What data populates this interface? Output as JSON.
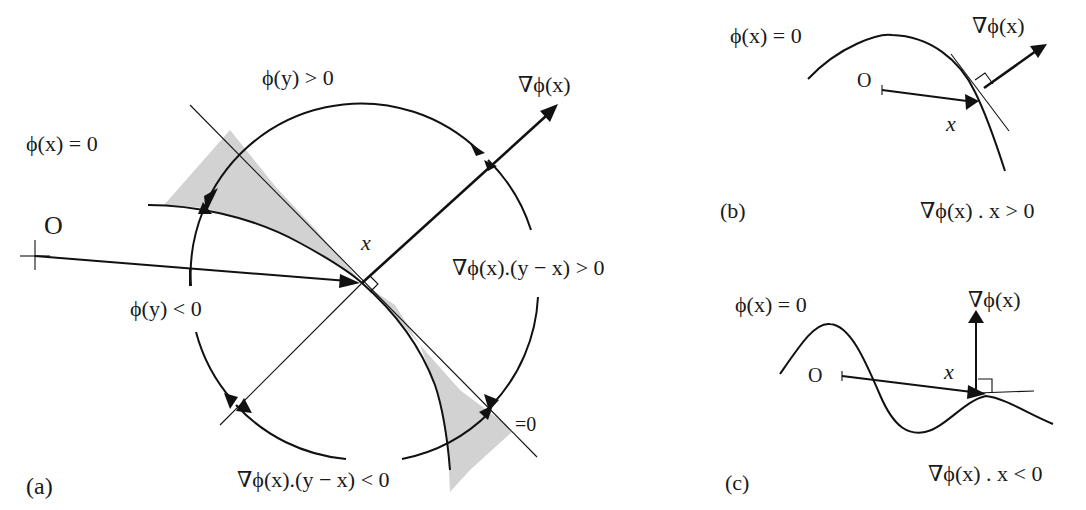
{
  "figure": {
    "panels": [
      {
        "id": "a",
        "caption": "(a)",
        "labels": {
          "phi_x_zero": "ϕ(x) = 0",
          "origin": "O",
          "phi_y_pos": "ϕ(y) > 0",
          "phi_y_neg": "ϕ(y) < 0",
          "grad": "∇ϕ(x)",
          "point_x": "x",
          "dot_pos": "∇ϕ(x).(y − x) > 0",
          "dot_neg": "∇ϕ(x).(y − x) < 0",
          "dot_zero": "=0"
        }
      },
      {
        "id": "b",
        "caption": "(b)",
        "labels": {
          "phi_x_zero": "ϕ(x) = 0",
          "origin": "O",
          "grad": "∇ϕ(x)",
          "point_x": "x",
          "condition": "∇ϕ(x) . x > 0"
        }
      },
      {
        "id": "c",
        "caption": "(c)",
        "labels": {
          "phi_x_zero": "ϕ(x) = 0",
          "origin": "O",
          "grad": "∇ϕ(x)",
          "point_x": "x",
          "condition": "∇ϕ(x) . x < 0"
        }
      }
    ],
    "colors": {
      "ink": "#111111",
      "shade": "#d2d2d2",
      "background": "#ffffff"
    }
  }
}
